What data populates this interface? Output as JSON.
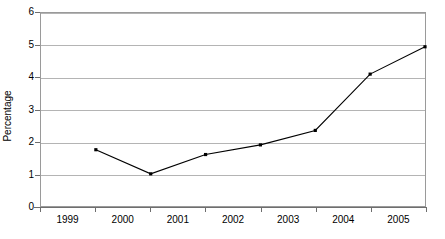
{
  "chart_data": {
    "type": "line",
    "title": "",
    "subtitle": "",
    "xlabel": "",
    "ylabel": "Percentage",
    "categories": [
      "1999",
      "2000",
      "2001",
      "2002",
      "2003",
      "2004",
      "2005"
    ],
    "values": [
      1.75,
      1.0,
      1.6,
      1.9,
      2.35,
      4.1,
      4.95
    ],
    "series": [
      {
        "name": "Percentage",
        "values": [
          1.75,
          1.0,
          1.6,
          1.9,
          2.35,
          4.1,
          4.95
        ]
      }
    ],
    "ylim": [
      0,
      6
    ],
    "y_ticks": [
      "0",
      "1",
      "2",
      "3",
      "4",
      "5",
      "6"
    ],
    "x_ticks": [
      "1999",
      "2000",
      "2001",
      "2002",
      "2003",
      "2004",
      "2005"
    ],
    "grid": "horizontal",
    "legend": "none",
    "marker": "square",
    "line_color": "#000000",
    "marker_color": "#000000",
    "grid_color": "#b4b4b4",
    "axis_color": "#6e6e6e",
    "background_color": "#ffffff",
    "annotations": []
  }
}
